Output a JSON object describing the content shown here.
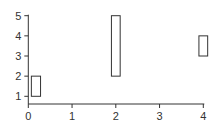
{
  "chart_data": {
    "type": "bar",
    "subtype": "floating-rectangles",
    "title": "",
    "xlabel": "",
    "ylabel": "",
    "xlim": [
      0,
      4
    ],
    "ylim": [
      0.6,
      5
    ],
    "x_ticks": [
      "0",
      "1",
      "2",
      "3",
      "4"
    ],
    "y_ticks": [
      "1",
      "2",
      "3",
      "4",
      "5"
    ],
    "grid": false,
    "legend": null,
    "rectangles": [
      {
        "x0": 0.07,
        "x1": 0.28,
        "y0": 1,
        "y1": 2
      },
      {
        "x0": 1.9,
        "x1": 2.1,
        "y0": 2,
        "y1": 5
      },
      {
        "x0": 3.9,
        "x1": 4.1,
        "y0": 3,
        "y1": 4
      }
    ],
    "colors": {
      "axis": "#333333",
      "rect_stroke": "#333333",
      "rect_fill": "#ffffff"
    }
  }
}
